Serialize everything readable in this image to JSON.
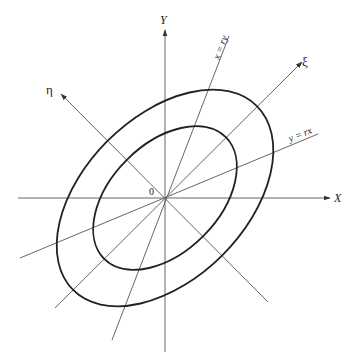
{
  "diagram": {
    "origin": {
      "x": 165,
      "y": 198
    },
    "labels": {
      "y_axis": "Y",
      "x_axis": "X",
      "xi_axis": "ξ",
      "eta_axis": "η",
      "origin": "0",
      "line_x_ry": "x = ry",
      "line_y_rx": "y = rx"
    },
    "ellipses": [
      {
        "name": "outer",
        "semi_major": 130,
        "semi_minor": 81,
        "rotation_deg": -45
      },
      {
        "name": "inner",
        "semi_major": 86,
        "semi_minor": 54,
        "rotation_deg": -45
      }
    ],
    "colors": {
      "axis": "#555555",
      "ellipse": "#222222",
      "text": "#222222"
    }
  }
}
